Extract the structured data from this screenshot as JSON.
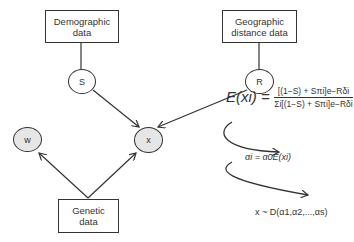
{
  "boxes": {
    "demographic": {
      "line1": "Demographic",
      "line2": "data"
    },
    "geographic": {
      "line1": "Geographic",
      "line2": "distance data"
    },
    "genetic": {
      "line1": "Genetic",
      "line2": "data"
    }
  },
  "nodes": {
    "s": {
      "label": "S",
      "type": "latent"
    },
    "r": {
      "label": "R",
      "type": "latent"
    },
    "x": {
      "label": "x",
      "type": "observed"
    },
    "w": {
      "label": "w",
      "type": "observed"
    }
  },
  "formulas": {
    "expected_lhs": "E(xi) =",
    "expected_numerator": "[(1−S) + Sπi]e−Rδi",
    "expected_denominator": "Σi[(1−S) + Sπi]e−Rδi",
    "alpha": "αi = α0E(xi)",
    "dirichlet": "x ~ D(α1,α2,...,αs)"
  },
  "colors": {
    "observed_fill": "#e6e6e6",
    "stroke": "#333333"
  }
}
